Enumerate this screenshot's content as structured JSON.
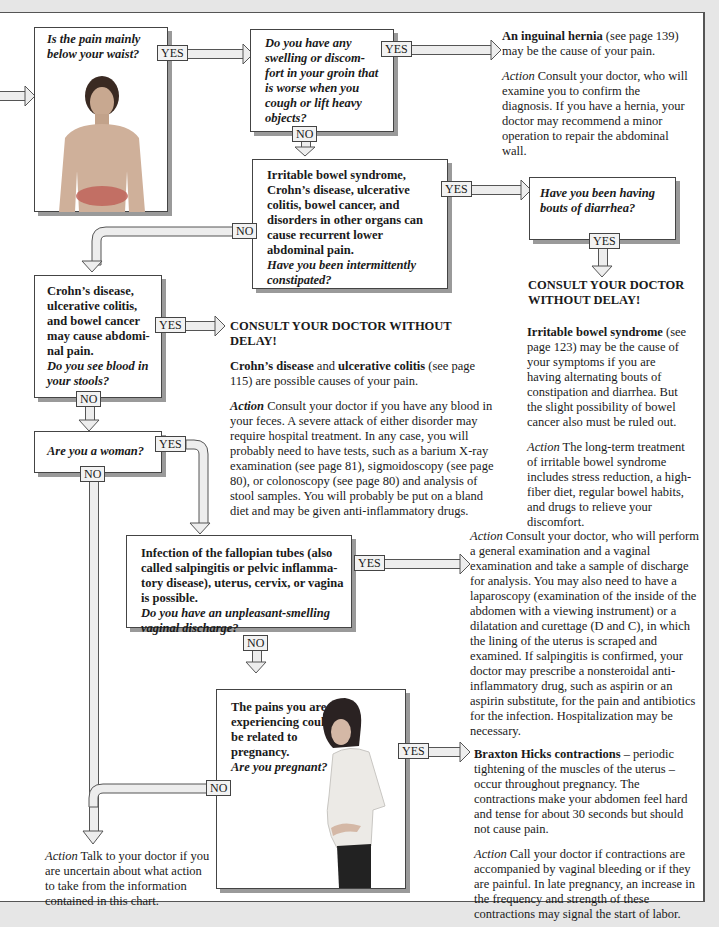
{
  "labels": {
    "yes": "YES",
    "no": "NO"
  },
  "nodes": {
    "q_below_waist": {
      "question": "Is the pain mainly below your waist?",
      "image": "man-torso-photo-with-lower-abdomen-highlighted"
    },
    "q_groin": {
      "question": "Do you have any swelling or discom-fort in your groin that is worse when you cough or lift heavy objects?"
    },
    "hernia": {
      "title": "An inguinal hernia",
      "ref": " (see page 139) may be the cause of your pain.",
      "action_label": "Action",
      "action_text": " Consult your doctor, who will examine you to confirm the diagnosis. If you have a hernia, your doctor may recommend a minor operation to repair the abdominal wall."
    },
    "q_ibs": {
      "statement": "Irritable bowel syndrome, Crohn’s disease, ulcerative colitis, bowel cancer, and disorders in other organs can cause recurrent lower abdominal pain.",
      "question": "Have you been intermittently constipated?"
    },
    "q_diarrhea": {
      "question": "Have you been having bouts of diarrhea?"
    },
    "consult_right": {
      "text": "CONSULT YOUR DOCTOR WITHOUT DELAY!"
    },
    "ibs_info": {
      "title": "Irritable bowel syndrome",
      "ref": " (see page 123) may be the cause of your symptoms if you are having alternating bouts of constipation and diarrhea. But the slight possibility of bowel cancer also must be ruled out.",
      "action_label": "Action",
      "action_text": " The long-term treatment of irritable bowel syndrome includes stress reduction, a high-fiber diet, regular bowel habits, and drugs to relieve your discomfort."
    },
    "q_blood": {
      "statement": "Crohn’s disease, ulcerative colitis, and bowel cancer may cause abdomi-nal pain.",
      "question": "Do you see blood in your stools?"
    },
    "consult_mid": {
      "text": "CONSULT YOUR DOCTOR WITHOUT DELAY!",
      "b1": "Crohn’s disease",
      "and": " and ",
      "b2": "ulcerative colitis",
      "ref": " (see page 115) are possible causes of your pain.",
      "action_label": "Action",
      "action_text": " Consult your doctor if you have any blood in your feces. A severe attack of either disorder may require hospital treatment. In any case, you will probably need to have tests, such as a barium X-ray examination (see page 81), sigmoidoscopy (see page 80), or colonoscopy (see page 80) and analysis of stool samples. You will probably be put on a bland diet and may be given anti-inflammatory drugs."
    },
    "q_woman": {
      "question": "Are you a woman?"
    },
    "q_discharge": {
      "statement": "Infection of the fallopian tubes (also called salpingitis or pelvic inflamma-tory disease), uterus, cervix, or vagina is possible.",
      "question": "Do you have an unpleasant-smelling vaginal discharge?"
    },
    "discharge_action": {
      "action_label": "Action",
      "action_text": " Consult your doctor, who will perform a general examination and a vaginal examination and take a sample of discharge for analysis. You may also need to have a laparoscopy (examination of the inside of the abdomen with a viewing instrument) or a dilatation and curettage (D and C), in which the lining of the uterus is scraped and examined. If salpingitis is confirmed, your doctor may prescribe a nonsteroidal anti-inflammatory drug, such as aspirin or an aspirin substitute, for the pain and antibiotics for the infection. Hospitalization may be necessary."
    },
    "q_pregnant": {
      "statement": "The pains you are experiencing could be related to pregnancy.",
      "question": "Are you pregnant?",
      "image": "pregnant-woman-photo"
    },
    "braxton": {
      "title": "Braxton Hicks contractions",
      "text": " – periodic tightening of the muscles of the uterus – occur throughout pregnancy. The contractions make your abdomen feel hard and tense for about 30 seconds but should not cause pain.",
      "action_label": "Action",
      "action_text": " Call your doctor if contractions are accompanied by vaginal bleeding or if they are painful. In late pregnancy, an increase in the frequency and strength of these contractions may signal the start of labor."
    },
    "final_action": {
      "action_label": "Action",
      "action_text": " Talk to your doctor if you are uncertain about what action to take from the information contained in this chart."
    }
  },
  "colors": {
    "page_bg": "#e6e6e6",
    "box_border": "#444444",
    "shadow": "#9a9a9a",
    "pipe_fill": "#ededed",
    "highlight": "#c0645a"
  }
}
